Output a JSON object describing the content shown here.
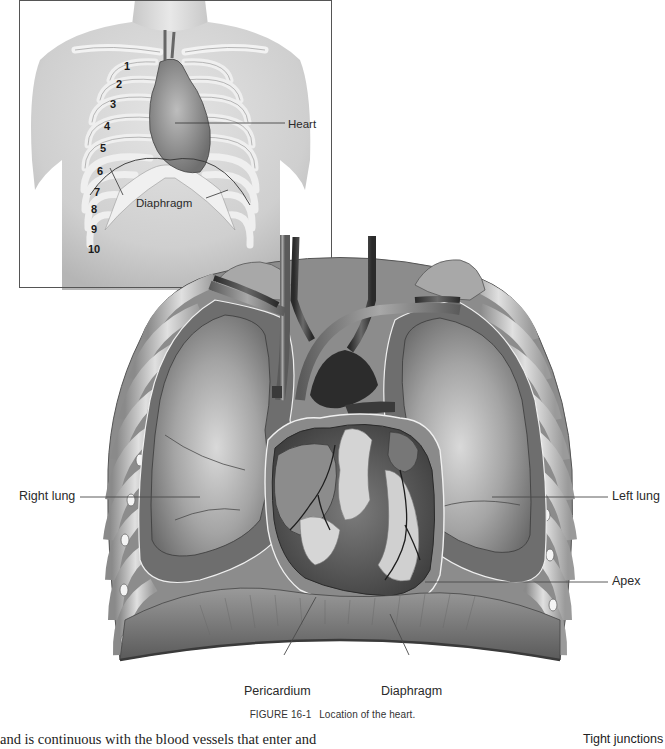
{
  "figure": {
    "number": "FIGURE 16-1",
    "caption": "Location of the heart."
  },
  "inset": {
    "rib_numbers": [
      "1",
      "2",
      "3",
      "4",
      "5",
      "6",
      "7",
      "8",
      "9",
      "10"
    ],
    "labels": {
      "heart": "Heart",
      "diaphragm": "Diaphragm"
    }
  },
  "main_labels": {
    "right_lung": "Right lung",
    "left_lung": "Left lung",
    "apex": "Apex",
    "pericardium": "Pericardium",
    "diaphragm": "Diaphragm"
  },
  "body_text": "and is continuous with the blood vessels that enter and",
  "side_text": "Tight junctions"
}
